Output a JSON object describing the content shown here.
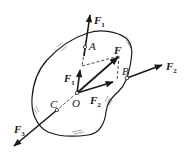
{
  "figure": {
    "points": {
      "A": "A",
      "B": "B",
      "C": "C",
      "O": "O",
      "F": "F"
    },
    "forces": {
      "F1_label": "F",
      "F1_sub": "1",
      "F1_inner_label": "F",
      "F1_inner_sub": "1",
      "F2_label": "F",
      "F2_sub": "2",
      "F2_inner_label": "F",
      "F2_inner_sub": "2",
      "F3_label": "F",
      "F3_sub": "3",
      "F_resultant": "F"
    },
    "colors": {
      "ink": "#1a1a1a",
      "background": "#ffffff"
    }
  }
}
